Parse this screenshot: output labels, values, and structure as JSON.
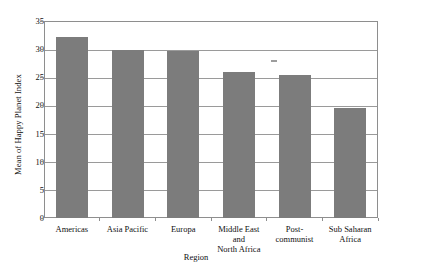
{
  "chart_data": {
    "type": "bar",
    "title": "",
    "xlabel": "Region",
    "ylabel": "Mean of Happy Planet Index",
    "categories": [
      "Americas",
      "Asia Pacific",
      "Europa",
      "Middle East and North Africa",
      "Post-communist",
      "Sub Saharan Africa"
    ],
    "values": [
      32.2,
      29.8,
      29.6,
      25.9,
      25.4,
      19.5
    ],
    "ylim": [
      0,
      35
    ],
    "ytick_values": [
      0,
      5,
      10,
      15,
      20,
      25,
      30,
      35
    ],
    "ytick_labels": [
      "0",
      "5",
      "10",
      "15",
      "20",
      "25",
      "30",
      "35"
    ],
    "grid": true,
    "legend": "none",
    "bar_color": "#7c7c7c",
    "axis_color": "#8e8e8e",
    "gridline_color": "#9a9a9a"
  },
  "side_chart_data": {
    "type": "bar",
    "title": "",
    "ylabel": "Mean of Happy Planet Index",
    "ylim": [
      0,
      27.5
    ],
    "ytick_values": [
      0,
      5,
      10,
      15,
      20,
      25
    ],
    "ytick_labels": [
      "0",
      "5",
      "10",
      "15",
      "20",
      "25"
    ],
    "values": [
      26.3
    ],
    "grid": true,
    "bar_color": "#7c7c7c"
  },
  "main": {
    "y_axis_title": "Mean of Happy Planet Index",
    "x_axis_title": "Region",
    "categories": [
      {
        "label_line1": "Americas",
        "label_line2": ""
      },
      {
        "label_line1": "Asia Pacific",
        "label_line2": ""
      },
      {
        "label_line1": "Europa",
        "label_line2": ""
      },
      {
        "label_line1": "Middle East and",
        "label_line2": "North Africa"
      },
      {
        "label_line1": "Post-",
        "label_line2": "communist"
      },
      {
        "label_line1": "Sub Saharan",
        "label_line2": "Africa"
      }
    ]
  },
  "side": {
    "y_axis_title": "Mean of Happy Planet Index"
  }
}
